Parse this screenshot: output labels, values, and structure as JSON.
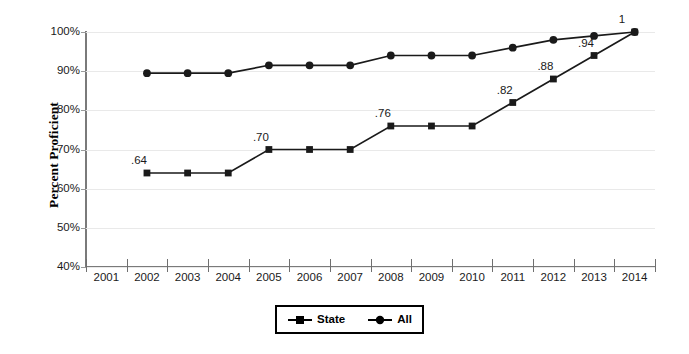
{
  "chart_data": {
    "type": "line",
    "title": "",
    "xlabel": "",
    "ylabel": "Percent Proficient",
    "categories": [
      "2001",
      "2002",
      "2003",
      "2004",
      "2005",
      "2006",
      "2007",
      "2008",
      "2009",
      "2010",
      "2011",
      "2012",
      "2013",
      "2014"
    ],
    "ylim": [
      40,
      100
    ],
    "ytick_labels": [
      "100%",
      "90%",
      "80%",
      "70%",
      "60%",
      "50%",
      "40%"
    ],
    "ytick_values": [
      100,
      90,
      80,
      70,
      60,
      50,
      40
    ],
    "grid": true,
    "legend_position": "bottom-center",
    "series": [
      {
        "name": "State",
        "marker": "square",
        "x": [
          "2002",
          "2003",
          "2004",
          "2005",
          "2006",
          "2007",
          "2008",
          "2009",
          "2010",
          "2011",
          "2012",
          "2013",
          "2014"
        ],
        "values": [
          64,
          64,
          64,
          70,
          70,
          70,
          76,
          76,
          76,
          82,
          88,
          94,
          100
        ],
        "data_labels": [
          {
            "x": "2002",
            "value": 64,
            "text": ".64"
          },
          {
            "x": "2005",
            "value": 70,
            "text": ".70"
          },
          {
            "x": "2008",
            "value": 76,
            "text": ".76"
          },
          {
            "x": "2011",
            "value": 82,
            "text": ".82"
          },
          {
            "x": "2012",
            "value": 88,
            "text": ".88"
          },
          {
            "x": "2013",
            "value": 94,
            "text": ".94"
          },
          {
            "x": "2014",
            "value": 100,
            "text": "1"
          }
        ]
      },
      {
        "name": "All",
        "marker": "circle",
        "x": [
          "2002",
          "2003",
          "2004",
          "2005",
          "2006",
          "2007",
          "2008",
          "2009",
          "2010",
          "2011",
          "2012",
          "2013",
          "2014"
        ],
        "values": [
          89.5,
          89.5,
          89.5,
          91.5,
          91.5,
          91.5,
          94,
          94,
          94,
          96,
          98,
          99,
          100
        ],
        "data_labels": []
      }
    ]
  },
  "legend": {
    "items": [
      {
        "label": "State",
        "marker": "square"
      },
      {
        "label": "All",
        "marker": "circle"
      }
    ]
  },
  "colors": {
    "series": "#1a1a1a",
    "grid": "#e9e9e9",
    "axis": "#7a7a7a",
    "text": "#1a1a1a",
    "background": "#ffffff"
  }
}
